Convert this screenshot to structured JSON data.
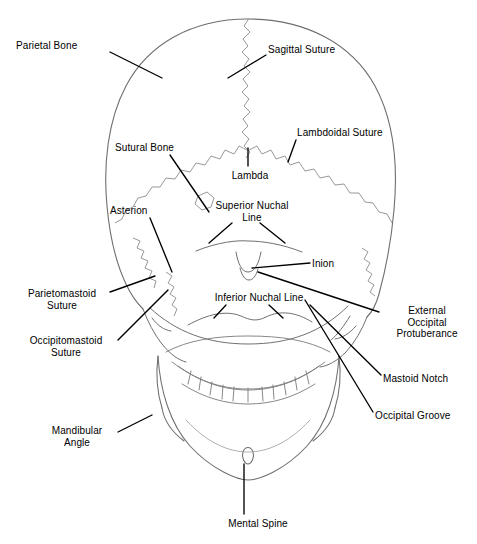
{
  "figure": {
    "background_color": "#ffffff",
    "outline_color": "#6e6e6e",
    "suture_color": "#8a8a8a",
    "leader_color": "#000000",
    "label_color": "#000000"
  },
  "labels": [
    {
      "id": "parietal-bone",
      "text": "Parietal Bone",
      "lines": [
        "Parietal Bone"
      ],
      "align": "left",
      "x": 16,
      "y": 40,
      "w": 90
    },
    {
      "id": "sagittal-suture",
      "text": "Sagittal Suture",
      "lines": [
        "Sagittal Suture"
      ],
      "align": "left",
      "x": 268,
      "y": 44,
      "w": 96
    },
    {
      "id": "lambdoidal-suture",
      "text": "Lambdoidal Suture",
      "lines": [
        "Lambdoidal Suture"
      ],
      "align": "left",
      "x": 297,
      "y": 127,
      "w": 110
    },
    {
      "id": "sutural-bone",
      "text": "Sutural Bone",
      "lines": [
        "Sutural Bone"
      ],
      "align": "left",
      "x": 115,
      "y": 142,
      "w": 86
    },
    {
      "id": "lambda",
      "text": "Lambda",
      "lines": [
        "Lambda"
      ],
      "align": "center",
      "x": 226,
      "y": 170,
      "w": 48
    },
    {
      "id": "superior-nuchal-line",
      "text": "Superior Nuchal Line",
      "lines": [
        "Superior Nuchal",
        "Line"
      ],
      "align": "center",
      "x": 208,
      "y": 200,
      "w": 88
    },
    {
      "id": "asterion",
      "text": "Asterion",
      "lines": [
        "Asterion"
      ],
      "align": "left",
      "x": 110,
      "y": 205,
      "w": 56
    },
    {
      "id": "inion",
      "text": "Inion",
      "lines": [
        "Inion"
      ],
      "align": "left",
      "x": 312,
      "y": 258,
      "w": 36
    },
    {
      "id": "inferior-nuchal-line",
      "text": "Inferior Nuchal Line",
      "lines": [
        "Inferior Nuchal Line"
      ],
      "align": "center",
      "x": 201,
      "y": 292,
      "w": 116
    },
    {
      "id": "parietomastoid-suture",
      "text": "Parietomastoid Suture",
      "lines": [
        "Parietomastoid",
        "Suture"
      ],
      "align": "center",
      "x": 16,
      "y": 288,
      "w": 92
    },
    {
      "id": "occipitomastoid-suture",
      "text": "Occipitomastoid Suture",
      "lines": [
        "Occipitomastoid",
        "Suture"
      ],
      "align": "center",
      "x": 16,
      "y": 335,
      "w": 100
    },
    {
      "id": "external-occipital-protuberance",
      "text": "External Occipital Protuberance",
      "lines": [
        "External",
        "Occipital",
        "Protuberance"
      ],
      "align": "center",
      "x": 381,
      "y": 305,
      "w": 92
    },
    {
      "id": "mastoid-notch",
      "text": "Mastoid Notch",
      "lines": [
        "Mastoid Notch"
      ],
      "align": "left",
      "x": 383,
      "y": 373,
      "w": 90
    },
    {
      "id": "occipital-groove",
      "text": "Occipital Groove",
      "lines": [
        "Occipital Groove"
      ],
      "align": "left",
      "x": 375,
      "y": 410,
      "w": 98
    },
    {
      "id": "mandibular-angle",
      "text": "Mandibular Angle",
      "lines": [
        "Mandibular",
        "Angle"
      ],
      "align": "center",
      "x": 38,
      "y": 425,
      "w": 78
    },
    {
      "id": "mental-spine",
      "text": "Mental Spine",
      "lines": [
        "Mental Spine"
      ],
      "align": "center",
      "x": 218,
      "y": 518,
      "w": 80
    }
  ],
  "leader_lines": [
    {
      "id": "leader-parietal-bone",
      "from": [
        110,
        52
      ],
      "to": [
        162,
        78
      ]
    },
    {
      "id": "leader-sagittal-suture",
      "from": [
        266,
        55
      ],
      "to": [
        228,
        78
      ]
    },
    {
      "id": "leader-lambdoidal-suture",
      "from": [
        296,
        140
      ],
      "to": [
        288,
        162
      ]
    },
    {
      "id": "leader-sutural-bone",
      "from": [
        170,
        155
      ],
      "to": [
        209,
        212
      ]
    },
    {
      "id": "leader-lambda",
      "from": [
        248,
        166
      ],
      "to": [
        248,
        148
      ]
    },
    {
      "id": "leader-superior-nuchal-left",
      "from": [
        232,
        223
      ],
      "to": [
        209,
        243
      ]
    },
    {
      "id": "leader-superior-nuchal-right",
      "from": [
        260,
        223
      ],
      "to": [
        285,
        243
      ]
    },
    {
      "id": "leader-asterion",
      "from": [
        150,
        218
      ],
      "to": [
        172,
        272
      ]
    },
    {
      "id": "leader-inion",
      "from": [
        310,
        263
      ],
      "to": [
        252,
        268
      ]
    },
    {
      "id": "leader-inferior-nuchal-left",
      "from": [
        226,
        305
      ],
      "to": [
        214,
        318
      ]
    },
    {
      "id": "leader-inferior-nuchal-right",
      "from": [
        269,
        305
      ],
      "to": [
        283,
        318
      ]
    },
    {
      "id": "leader-parietomastoid-suture",
      "from": [
        110,
        292
      ],
      "to": [
        155,
        276
      ]
    },
    {
      "id": "leader-occipitomastoid-suture",
      "from": [
        118,
        340
      ],
      "to": [
        168,
        290
      ]
    },
    {
      "id": "leader-eop",
      "from": [
        379,
        312
      ],
      "to": [
        258,
        272
      ]
    },
    {
      "id": "leader-mastoid-notch",
      "from": [
        381,
        375
      ],
      "to": [
        310,
        305
      ]
    },
    {
      "id": "leader-occipital-groove",
      "from": [
        373,
        412
      ],
      "to": [
        305,
        300
      ]
    },
    {
      "id": "leader-mandibular-angle",
      "from": [
        118,
        432
      ],
      "to": [
        152,
        415
      ]
    },
    {
      "id": "leader-mental-spine",
      "from": [
        244,
        514
      ],
      "to": [
        244,
        464
      ]
    }
  ]
}
